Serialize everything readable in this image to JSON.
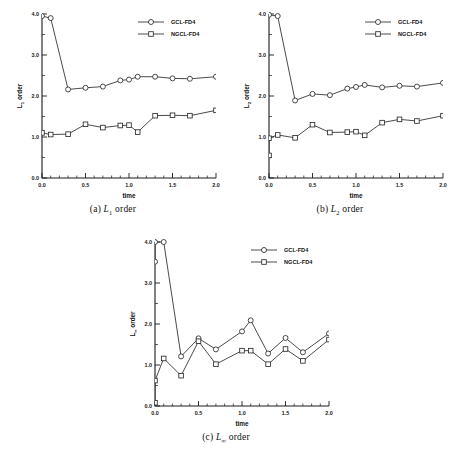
{
  "figure": {
    "background": "#ffffff",
    "line_color": "#2b2b2b",
    "marker_fill": "#ffffff"
  },
  "panels": [
    {
      "id": "panel-a",
      "caption_index": "(a)",
      "caption_symbol": "L",
      "caption_sub": "1",
      "caption_suffix": " order",
      "caption": "(a) L1 order",
      "ylabel_symbol": "L",
      "ylabel_sub": "1",
      "ylabel_suffix": " order",
      "xlabel": "time",
      "xticks": [
        "0.0",
        "0.5",
        "1.0",
        "1.5",
        "2.0"
      ],
      "yticks": [
        "0.0",
        "1.0",
        "2.0",
        "3.0",
        "4.0"
      ],
      "chart_data": {
        "type": "line",
        "title": "(a) L1 order",
        "xlabel": "time",
        "ylabel": "L1 order",
        "xlim": [
          0.0,
          2.0
        ],
        "ylim": [
          0.0,
          4.0
        ],
        "grid": false,
        "legend_position": "top-right",
        "series": [
          {
            "name": "GCL-FD4",
            "marker": "circle",
            "x": [
              0.0,
              0.1,
              0.3,
              0.5,
              0.7,
              0.9,
              1.0,
              1.1,
              1.3,
              1.5,
              1.7,
              2.0
            ],
            "y": [
              3.95,
              3.9,
              2.16,
              2.2,
              2.23,
              2.38,
              2.4,
              2.47,
              2.47,
              2.43,
              2.42,
              2.47
            ]
          },
          {
            "name": "NGCL-FD4",
            "marker": "square",
            "x": [
              0.0,
              0.1,
              0.3,
              0.5,
              0.7,
              0.9,
              1.0,
              1.1,
              1.3,
              1.5,
              1.7,
              2.0
            ],
            "y": [
              1.1,
              1.06,
              1.07,
              1.31,
              1.23,
              1.28,
              1.29,
              1.12,
              1.52,
              1.53,
              1.52,
              1.65
            ]
          }
        ]
      }
    },
    {
      "id": "panel-b",
      "caption_index": "(b)",
      "caption_symbol": "L",
      "caption_sub": "2",
      "caption_suffix": " order",
      "caption": "(b) L2 order",
      "ylabel_symbol": "L",
      "ylabel_sub": "2",
      "ylabel_suffix": " order",
      "xlabel": "time",
      "xticks": [
        "0.0",
        "0.5",
        "1.0",
        "1.5",
        "2.0"
      ],
      "yticks": [
        "0.0",
        "1.0",
        "2.0",
        "3.0",
        "4.0"
      ],
      "chart_data": {
        "type": "line",
        "title": "(b) L2 order",
        "xlabel": "time",
        "ylabel": "L2 order",
        "xlim": [
          0.0,
          2.0
        ],
        "ylim": [
          0.0,
          4.0
        ],
        "grid": false,
        "legend_position": "top-right",
        "series": [
          {
            "name": "GCL-FD4",
            "marker": "circle",
            "x": [
              0.0,
              0.1,
              0.3,
              0.5,
              0.7,
              0.9,
              1.0,
              1.1,
              1.3,
              1.5,
              1.7,
              2.0
            ],
            "y": [
              3.98,
              3.95,
              1.89,
              2.05,
              2.02,
              2.18,
              2.22,
              2.27,
              2.21,
              2.25,
              2.23,
              2.32
            ]
          },
          {
            "name": "NGCL-FD4",
            "marker": "square",
            "x": [
              0.0,
              0.0,
              0.1,
              0.3,
              0.5,
              0.7,
              0.9,
              1.0,
              1.1,
              1.3,
              1.5,
              1.7,
              2.0
            ],
            "y": [
              0.55,
              0.97,
              1.05,
              0.98,
              1.3,
              1.11,
              1.12,
              1.13,
              1.04,
              1.35,
              1.43,
              1.39,
              1.52
            ]
          }
        ]
      }
    },
    {
      "id": "panel-c",
      "caption_index": "(c)",
      "caption_symbol": "L",
      "caption_sub": "∞",
      "caption_suffix": " order",
      "caption": "(c) L∞ order",
      "ylabel_symbol": "L",
      "ylabel_sub": "∞",
      "ylabel_suffix": " order",
      "xlabel": "time",
      "xticks": [
        "0.0",
        "0.5",
        "1.0",
        "1.5",
        "2.0"
      ],
      "yticks": [
        "0.0",
        "1.0",
        "2.0",
        "3.0",
        "4.0"
      ],
      "chart_data": {
        "type": "line",
        "title": "(c) Linf order",
        "xlabel": "time",
        "ylabel": "Linf order",
        "xlim": [
          0.0,
          2.0
        ],
        "ylim": [
          0.0,
          4.0
        ],
        "grid": false,
        "legend_position": "top-right",
        "series": [
          {
            "name": "GCL-FD4",
            "marker": "circle",
            "x": [
              0.0,
              0.0,
              0.1,
              0.3,
              0.5,
              0.7,
              1.0,
              1.1,
              1.3,
              1.5,
              1.7,
              2.0
            ],
            "y": [
              3.52,
              4.0,
              4.0,
              1.21,
              1.65,
              1.38,
              1.82,
              2.09,
              1.28,
              1.66,
              1.31,
              1.77
            ]
          },
          {
            "name": "NGCL-FD4",
            "marker": "square",
            "x": [
              0.0,
              0.0,
              0.1,
              0.3,
              0.5,
              0.7,
              1.0,
              1.1,
              1.3,
              1.5,
              1.7,
              2.0
            ],
            "y": [
              0.08,
              0.62,
              1.16,
              0.74,
              1.58,
              1.02,
              1.35,
              1.35,
              1.02,
              1.39,
              1.1,
              1.62
            ]
          }
        ]
      }
    }
  ],
  "legend": {
    "entries": [
      {
        "label": "GCL-FD4",
        "marker": "circle"
      },
      {
        "label": "NGCL-FD4",
        "marker": "square"
      }
    ]
  }
}
